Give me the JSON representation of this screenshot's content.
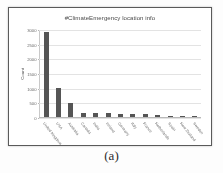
{
  "figure": {
    "caption": "(a)"
  },
  "chart_data": {
    "type": "bar",
    "title": "#ClimateEmergency location info",
    "xlabel": "",
    "ylabel": "Count",
    "categories": [
      "United Kingdom",
      "USA",
      "Australia",
      "Canada",
      "India",
      "Ireland",
      "Germany",
      "Italy",
      "France",
      "Netherlands",
      "Spain",
      "New Zealand",
      "Sweden"
    ],
    "values": [
      2900,
      1000,
      490,
      140,
      130,
      120,
      115,
      100,
      95,
      80,
      45,
      35,
      25
    ],
    "ylim": [
      0,
      3000
    ],
    "yticks": [
      0,
      500,
      1000,
      1500,
      2000,
      2500,
      3000
    ],
    "ytick_labels": [
      "0",
      "500",
      "1000",
      "1500",
      "2000",
      "2500",
      "3000"
    ],
    "grid": true,
    "legend": false,
    "bar_color": "#555555",
    "gridline_color": "#e3e3e3",
    "axis_color": "#b9b9b9",
    "title_color": "#4a4a4a"
  }
}
